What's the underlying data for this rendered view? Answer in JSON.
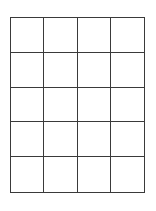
{
  "grid": {
    "columns": 4,
    "rows": 5,
    "line_color": "#3a3a3a",
    "background": "#ffffff",
    "cells": [
      [
        "",
        "",
        "",
        ""
      ],
      [
        "",
        "",
        "",
        ""
      ],
      [
        "",
        "",
        "",
        ""
      ],
      [
        "",
        "",
        "",
        ""
      ],
      [
        "",
        "",
        "",
        ""
      ]
    ]
  }
}
